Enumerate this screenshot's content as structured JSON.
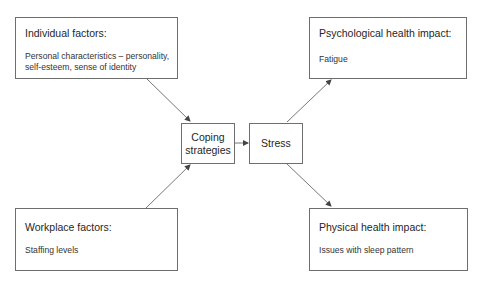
{
  "diagram": {
    "nodes": {
      "individual": {
        "title": "Individual factors:",
        "body_line1": "Personal characteristics – personality,",
        "body_line2": "self-esteem, sense of identity"
      },
      "workplace": {
        "title": "Workplace factors:",
        "body": "Staffing levels"
      },
      "coping": {
        "line1": "Coping",
        "line2": "strategies"
      },
      "stress": {
        "label": "Stress"
      },
      "psychological": {
        "title": "Psychological health impact:",
        "body": "Fatigue"
      },
      "physical": {
        "title": "Physical health impact:",
        "body": "Issues with sleep pattern"
      }
    },
    "edges": [
      {
        "from": "individual",
        "to": "coping"
      },
      {
        "from": "workplace",
        "to": "coping"
      },
      {
        "from": "coping",
        "to": "stress"
      },
      {
        "from": "stress",
        "to": "psychological"
      },
      {
        "from": "stress",
        "to": "physical"
      }
    ],
    "colors": {
      "border": "#6e6e6e",
      "arrow": "#555555",
      "text": "#262626"
    }
  }
}
